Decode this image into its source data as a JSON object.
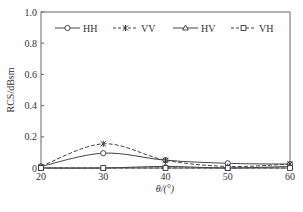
{
  "chart_data": {
    "type": "line",
    "title": "",
    "xlabel": "θ/(°)",
    "ylabel": "RCS/dBsm",
    "x": [
      20,
      30,
      40,
      50,
      60
    ],
    "xlim": [
      20,
      60
    ],
    "ylim": [
      0,
      1.0
    ],
    "xticks": [
      "20",
      "30",
      "40",
      "50",
      "60"
    ],
    "yticks": [
      "0",
      "0.2",
      "0.4",
      "0.6",
      "0.8",
      "1.0"
    ],
    "grid": false,
    "legend_position": "top, inside plot",
    "series": [
      {
        "name": "HH",
        "style": "solid",
        "marker": "circle",
        "values": [
          0.01,
          0.095,
          0.05,
          0.03,
          0.025
        ]
      },
      {
        "name": "VV",
        "style": "dashed",
        "marker": "asterisk",
        "values": [
          0.01,
          0.155,
          0.05,
          0.01,
          0.025
        ]
      },
      {
        "name": "HV",
        "style": "solid",
        "marker": "triangle",
        "values": [
          0.0,
          0.0,
          0.01,
          0.0,
          0.01
        ]
      },
      {
        "name": "VH",
        "style": "dashed",
        "marker": "square",
        "values": [
          0.0,
          0.0,
          0.0,
          0.0,
          0.0
        ]
      }
    ]
  }
}
